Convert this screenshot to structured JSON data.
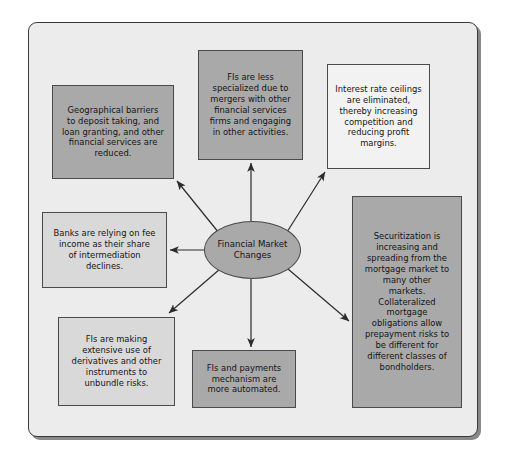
{
  "diagram": {
    "title_hub": "Financial Market\nChanges",
    "colors": {
      "frame_bg": "#ececec",
      "frame_border": "#3a3a3a",
      "node_dark": "#a9a9a9",
      "node_light": "#d9d9d9",
      "node_pale": "#f2f2f2",
      "text": "#141414",
      "arrow": "#2b2b2b"
    },
    "hub": {
      "label": "Financial Market\nChanges",
      "shape": "ellipse",
      "fill": "#a9a9a9"
    },
    "nodes": [
      {
        "id": "geographical",
        "label": "Geographical barriers\nto deposit taking, and\nloan granting, and other\nfinancial services are\nreduced.",
        "fill": "#a9a9a9"
      },
      {
        "id": "less-specialized",
        "label": "FIs are less\nspecialized due to\nmergers with other\nfinancial services\nfirms and engaging\nin other activities.",
        "fill": "#a9a9a9"
      },
      {
        "id": "rate-ceilings",
        "label": "Interest rate ceilings\nare eliminated,\nthereby increasing\ncompetition and\nreducing profit\nmargins.",
        "fill": "#f2f2f2"
      },
      {
        "id": "banks-fee",
        "label": "Banks are relying on fee\nincome as their share\nof intermediation\ndeclines.",
        "fill": "#d9d9d9"
      },
      {
        "id": "securitization",
        "label": "Securitization is\nincreasing and\nspreading from the\nmortgage market to\nmany other\nmarkets.\nCollateralized\nmortgage\nobligations allow\nprepayment risks to\nbe different for\ndifferent classes of\nbondholders.",
        "fill": "#a9a9a9"
      },
      {
        "id": "derivatives",
        "label": "FIs are making\nextensive use of\nderivatives and other\ninstruments to\nunbundle risks.",
        "fill": "#d9d9d9"
      },
      {
        "id": "payments",
        "label": "FIs and payments\nmechanism are\nmore automated.",
        "fill": "#a9a9a9"
      }
    ],
    "connectors": [
      {
        "from": "hub",
        "to": "geographical",
        "name": "arrow-hub-to-geographical"
      },
      {
        "from": "hub",
        "to": "less-specialized",
        "name": "arrow-hub-to-less-specialized"
      },
      {
        "from": "hub",
        "to": "rate-ceilings",
        "name": "arrow-hub-to-rate-ceilings"
      },
      {
        "from": "hub",
        "to": "banks-fee",
        "name": "arrow-hub-to-banks-fee"
      },
      {
        "from": "hub",
        "to": "securitization",
        "name": "arrow-hub-to-securitization"
      },
      {
        "from": "hub",
        "to": "derivatives",
        "name": "arrow-hub-to-derivatives"
      },
      {
        "from": "hub",
        "to": "payments",
        "name": "arrow-hub-to-payments"
      }
    ]
  }
}
